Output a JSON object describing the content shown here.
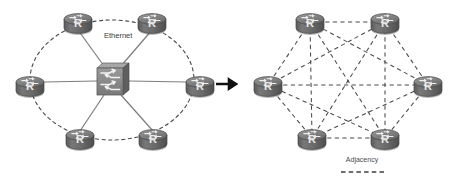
{
  "figure": {
    "type": "network-topology-comparison",
    "background_color": "#ffffff",
    "labels": {
      "ethernet": "Ethernet",
      "adjacency": "Adjacency"
    },
    "router_letter": "R",
    "colors": {
      "router_body": "#6e6e6e",
      "router_body_dark": "#555555",
      "router_top": "#8a8a8a",
      "switch_face": "#8d8d8d",
      "switch_side": "#5f5f5f",
      "switch_top": "#a5a5a5",
      "link_solid": "#808080",
      "link_dashed": "#4a4a4a",
      "arrow": "#111111",
      "text": "#3a3a3a"
    }
  },
  "left_panel": {
    "name": "ethernet-segment-topology",
    "caption": "Ethernet",
    "caption_position": {
      "x": 104,
      "y": 38
    },
    "center_device": {
      "name": "ethernet-switch",
      "kind": "switch",
      "x": 112,
      "y": 80
    },
    "ellipse": {
      "cx": 112,
      "cy": 80,
      "rx": 82,
      "ry": 60,
      "style": "dashed"
    },
    "routers": [
      {
        "id": "L1",
        "label": "R",
        "x": 78,
        "y": 22
      },
      {
        "id": "L2",
        "label": "R",
        "x": 152,
        "y": 22
      },
      {
        "id": "L3",
        "label": "R",
        "x": 30,
        "y": 85
      },
      {
        "id": "L4",
        "label": "R",
        "x": 200,
        "y": 85
      },
      {
        "id": "L5",
        "label": "R",
        "x": 80,
        "y": 138
      },
      {
        "id": "L6",
        "label": "R",
        "x": 153,
        "y": 138
      }
    ],
    "solid_links": [
      [
        "L1",
        "SW"
      ],
      [
        "L2",
        "SW"
      ],
      [
        "L3",
        "SW"
      ],
      [
        "L4",
        "SW"
      ],
      [
        "L5",
        "SW"
      ],
      [
        "L6",
        "SW"
      ]
    ]
  },
  "transition": {
    "name": "transition-arrow",
    "glyph": "right-arrow",
    "x": 224,
    "y": 84,
    "color": "#111111"
  },
  "right_panel": {
    "name": "full-mesh-adjacency-topology",
    "routers": [
      {
        "id": "R1",
        "label": "R",
        "x": 310,
        "y": 22
      },
      {
        "id": "R2",
        "label": "R",
        "x": 385,
        "y": 22
      },
      {
        "id": "R3",
        "label": "R",
        "x": 268,
        "y": 85
      },
      {
        "id": "R4",
        "label": "R",
        "x": 428,
        "y": 85
      },
      {
        "id": "R5",
        "label": "R",
        "x": 312,
        "y": 138
      },
      {
        "id": "R6",
        "label": "R",
        "x": 385,
        "y": 138
      }
    ],
    "mesh_links": [
      [
        "R1",
        "R2"
      ],
      [
        "R1",
        "R3"
      ],
      [
        "R1",
        "R4"
      ],
      [
        "R1",
        "R5"
      ],
      [
        "R1",
        "R6"
      ],
      [
        "R2",
        "R3"
      ],
      [
        "R2",
        "R4"
      ],
      [
        "R2",
        "R5"
      ],
      [
        "R2",
        "R6"
      ],
      [
        "R3",
        "R4"
      ],
      [
        "R3",
        "R5"
      ],
      [
        "R3",
        "R6"
      ],
      [
        "R4",
        "R5"
      ],
      [
        "R4",
        "R6"
      ],
      [
        "R5",
        "R6"
      ]
    ],
    "legend": {
      "label": "Adjacency",
      "label_position": {
        "x": 362,
        "y": 162
      },
      "swatch": {
        "x1": 341,
        "y1": 172,
        "x2": 384,
        "y2": 172,
        "style": "dashed"
      }
    }
  }
}
